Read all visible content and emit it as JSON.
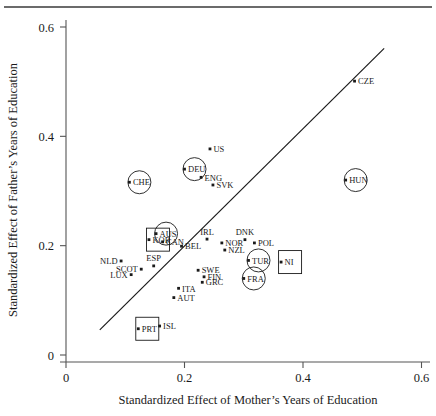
{
  "figure": {
    "title": "",
    "top_rule": true,
    "background_color": "#ffffff",
    "foreground_color": "#1a1a1a"
  },
  "axes": {
    "x_title": "Standardized Effect of Mother’s Years of Education",
    "y_title": "Standardized Effect of Father’s Years of Education",
    "x_ticks": [
      "0",
      "0.2",
      "0.4",
      "0.6"
    ],
    "y_ticks": [
      "0",
      "0.2",
      "0.4",
      "0.6"
    ]
  },
  "chart_data": {
    "type": "scatter",
    "title": "",
    "xlabel": "Standardized Effect of Mother’s Years of Education",
    "ylabel": "Standardized Effect of Father’s Years of Education",
    "xlim": [
      0,
      0.6
    ],
    "ylim": [
      0,
      0.6
    ],
    "xticks": [
      0,
      0.2,
      0.4,
      0.6
    ],
    "yticks": [
      0,
      0.2,
      0.4,
      0.6
    ],
    "grid": false,
    "legend": null,
    "fit_line": {
      "type": "linear-reference",
      "x_start": 0.057,
      "y_start": 0.046,
      "x_end": 0.537,
      "y_end": 0.561
    },
    "points": [
      {
        "label": "CZE",
        "x": 0.487,
        "y": 0.501,
        "label_pos": "right",
        "highlight": "none"
      },
      {
        "label": "US",
        "x": 0.243,
        "y": 0.377,
        "label_pos": "right",
        "highlight": "none"
      },
      {
        "label": "DEU",
        "x": 0.2,
        "y": 0.34,
        "label_pos": "right",
        "highlight": "circle"
      },
      {
        "label": "HUN",
        "x": 0.472,
        "y": 0.32,
        "label_pos": "right",
        "highlight": "circle"
      },
      {
        "label": "CHE",
        "x": 0.107,
        "y": 0.316,
        "label_pos": "right",
        "highlight": "circle"
      },
      {
        "label": "ENG",
        "x": 0.228,
        "y": 0.325,
        "label_pos": "right",
        "highlight": "none"
      },
      {
        "label": "SVK",
        "x": 0.248,
        "y": 0.311,
        "label_pos": "right",
        "highlight": "none"
      },
      {
        "label": "AUS",
        "x": 0.152,
        "y": 0.222,
        "label_pos": "right",
        "highlight": "circle"
      },
      {
        "label": "KOR",
        "x": 0.14,
        "y": 0.211,
        "label_pos": "right",
        "highlight": "square"
      },
      {
        "label": "CAN",
        "x": 0.163,
        "y": 0.207,
        "label_pos": "right",
        "highlight": "none"
      },
      {
        "label": "BEL",
        "x": 0.195,
        "y": 0.199,
        "label_pos": "right",
        "highlight": "none"
      },
      {
        "label": "IRL",
        "x": 0.238,
        "y": 0.212,
        "label_pos": "above",
        "highlight": "none"
      },
      {
        "label": "NOR",
        "x": 0.263,
        "y": 0.205,
        "label_pos": "right",
        "highlight": "none"
      },
      {
        "label": "NZL",
        "x": 0.268,
        "y": 0.192,
        "label_pos": "right",
        "highlight": "none"
      },
      {
        "label": "DNK",
        "x": 0.302,
        "y": 0.211,
        "label_pos": "above",
        "highlight": "none"
      },
      {
        "label": "POL",
        "x": 0.318,
        "y": 0.205,
        "label_pos": "right",
        "highlight": "none"
      },
      {
        "label": "TUR",
        "x": 0.308,
        "y": 0.173,
        "label_pos": "right",
        "highlight": "circle"
      },
      {
        "label": "NI",
        "x": 0.363,
        "y": 0.17,
        "label_pos": "right",
        "highlight": "square"
      },
      {
        "label": "FRA",
        "x": 0.3,
        "y": 0.14,
        "label_pos": "right",
        "highlight": "circle"
      },
      {
        "label": "NLD",
        "x": 0.093,
        "y": 0.172,
        "label_pos": "left",
        "highlight": "none"
      },
      {
        "label": "ESP",
        "x": 0.148,
        "y": 0.163,
        "label_pos": "above",
        "highlight": "none"
      },
      {
        "label": "SCOT",
        "x": 0.127,
        "y": 0.157,
        "label_pos": "left",
        "highlight": "none"
      },
      {
        "label": "LUX",
        "x": 0.11,
        "y": 0.147,
        "label_pos": "left",
        "highlight": "none"
      },
      {
        "label": "SWE",
        "x": 0.223,
        "y": 0.155,
        "label_pos": "right",
        "highlight": "none"
      },
      {
        "label": "FIN",
        "x": 0.233,
        "y": 0.143,
        "label_pos": "right",
        "highlight": "none"
      },
      {
        "label": "GRC",
        "x": 0.23,
        "y": 0.133,
        "label_pos": "right",
        "highlight": "none"
      },
      {
        "label": "ITA",
        "x": 0.19,
        "y": 0.122,
        "label_pos": "right",
        "highlight": "none"
      },
      {
        "label": "AUT",
        "x": 0.182,
        "y": 0.105,
        "label_pos": "right",
        "highlight": "none"
      },
      {
        "label": "PRT",
        "x": 0.122,
        "y": 0.048,
        "label_pos": "right",
        "highlight": "square"
      },
      {
        "label": "ISL",
        "x": 0.158,
        "y": 0.053,
        "label_pos": "right",
        "highlight": "none"
      }
    ]
  }
}
